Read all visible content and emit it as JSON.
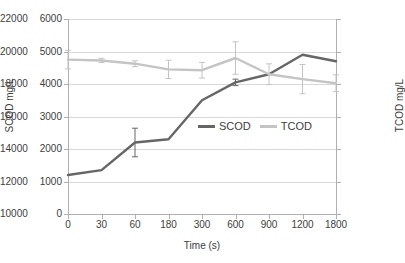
{
  "chart_data": {
    "type": "line",
    "title": "",
    "xlabel": "Time (s)",
    "ylabel": "SCOD mg/L",
    "y2label": "TCOD mg/L",
    "categories": [
      "0",
      "30",
      "60",
      "180",
      "300",
      "600",
      "900",
      "1200",
      "1800"
    ],
    "ylim": [
      0,
      6000
    ],
    "yticks": [
      "6000",
      "5000",
      "4000",
      "3000",
      "2000",
      "1000",
      "0"
    ],
    "y2lim": [
      10000,
      22000
    ],
    "y2ticks": [
      "22000",
      "20000",
      "18000",
      "16000",
      "14000",
      "12000",
      "10000"
    ],
    "grid": true,
    "legend_position": "inside-center",
    "series": [
      {
        "name": "SCOD",
        "axis": "left",
        "color": "#666666",
        "values": [
          1200,
          1350,
          2200,
          2300,
          3500,
          4050,
          4300,
          4900,
          4700
        ],
        "errors": [
          0,
          0,
          440,
          0,
          0,
          100,
          0,
          0,
          0
        ]
      },
      {
        "name": "TCOD",
        "axis": "right",
        "color": "#c4c4c4",
        "values": [
          19500,
          19450,
          19250,
          18900,
          18850,
          19600,
          18600,
          18300,
          18050
        ],
        "errors": [
          570,
          130,
          180,
          560,
          480,
          1000,
          640,
          900,
          520
        ]
      }
    ]
  },
  "legend": {
    "items": [
      {
        "label": "SCOD",
        "color": "#666666"
      },
      {
        "label": "TCOD",
        "color": "#c4c4c4"
      }
    ]
  },
  "axis_titles": {
    "x": "Time (s)",
    "y_left": "SCOD mg/L",
    "y_right": "TCOD mg/L"
  }
}
